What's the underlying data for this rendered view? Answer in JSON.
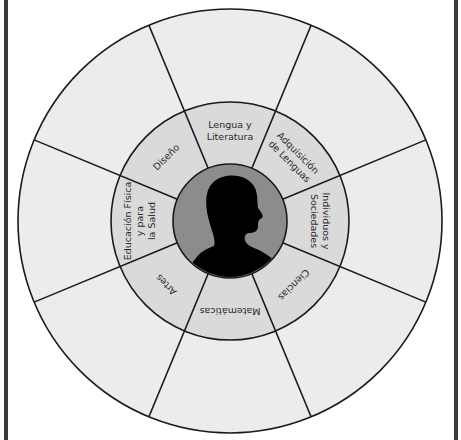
{
  "diagram": {
    "title": "",
    "center": {
      "icon": "person-silhouette-icon",
      "description": "Alumno"
    },
    "colors": {
      "outer_ring": "#ececec",
      "middle_ring": "#dadada",
      "inner_disc": "#8c8c8c",
      "silhouette": "#000000",
      "stroke": "#1a1a1a",
      "frame": "#3a3a3a"
    },
    "subjects": [
      {
        "id": "lengua",
        "lines": [
          "Lengua y",
          "Literatura"
        ],
        "angle": 0
      },
      {
        "id": "adquisicion",
        "lines": [
          "Adquisición",
          "de Lenguas"
        ],
        "angle": 45
      },
      {
        "id": "individuos",
        "lines": [
          "Individuos y",
          "Sociedades"
        ],
        "angle": 90
      },
      {
        "id": "ciencias",
        "lines": [
          "Ciencias"
        ],
        "angle": 135
      },
      {
        "id": "matematicas",
        "lines": [
          "Matemáticas"
        ],
        "angle": 180
      },
      {
        "id": "artes",
        "lines": [
          "Artes"
        ],
        "angle": 225
      },
      {
        "id": "educacion-fisica",
        "lines": [
          "Educación Física",
          "y para",
          "la Salud"
        ],
        "angle": 270
      },
      {
        "id": "diseno",
        "lines": [
          "Diseño"
        ],
        "angle": 315
      }
    ]
  }
}
